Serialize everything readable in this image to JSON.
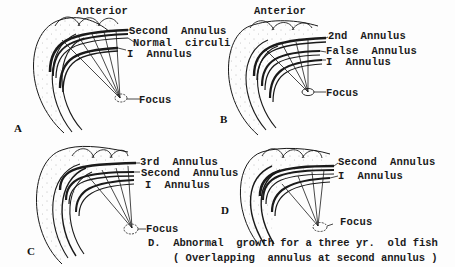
{
  "figure": {
    "panels": [
      {
        "id": "A",
        "header": "Anterior",
        "labels": [
          "Second  Annulus",
          "Normal  circuli",
          "I  Annulus"
        ],
        "focus_label": "Focus"
      },
      {
        "id": "B",
        "header": "Anterior",
        "labels": [
          "2nd  Annulus",
          "False  Annulus",
          "I  Annulus"
        ],
        "focus_label": "Focus"
      },
      {
        "id": "C",
        "header": "",
        "labels": [
          "3rd  Annulus",
          "Second  Annulus",
          "I  Annulus"
        ],
        "focus_label": "Focus"
      },
      {
        "id": "D",
        "header": "",
        "labels": [
          "Second  Annulus",
          "I  Annulus"
        ],
        "focus_label": "Focus"
      }
    ],
    "caption": {
      "line1": "D.  Abnormal  growth for a three yr.  old fish",
      "line2": "( Overlapping  annulus at second annulus )"
    },
    "colors": {
      "ink": "#1a1a1a",
      "paper": "#fdfdfd"
    }
  }
}
